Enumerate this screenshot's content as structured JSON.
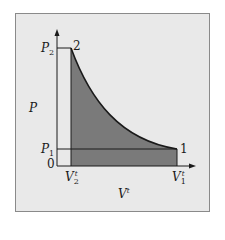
{
  "diagram": {
    "type": "pv-diagram",
    "axes": {
      "y_label": "P",
      "x_label": "V",
      "x_label_superscript": "t",
      "origin_label": "0"
    },
    "y_ticks": [
      {
        "base": "P",
        "sub": "2"
      },
      {
        "base": "P",
        "sub": "1"
      }
    ],
    "x_ticks": [
      {
        "base": "V",
        "sub": "2",
        "sup": "t"
      },
      {
        "base": "V",
        "sub": "1",
        "sup": "t"
      }
    ],
    "points": [
      {
        "label": "1"
      },
      {
        "label": "2"
      }
    ],
    "colors": {
      "panel_bg": "#e9e9e9",
      "shaded_area": "#7a7a7a",
      "lines": "#1a1a1a"
    }
  }
}
